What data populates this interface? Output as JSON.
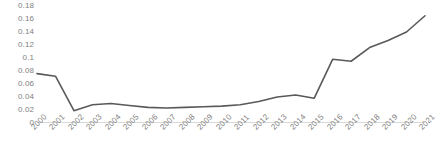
{
  "chart_data": {
    "type": "line",
    "title": "",
    "subtitle": "",
    "xlabel": "",
    "ylabel": "",
    "categories": [
      "2000",
      "2001",
      "2002",
      "2003",
      "2004",
      "2005",
      "2006",
      "2007",
      "2008",
      "2009",
      "2010",
      "2011",
      "2012",
      "2013",
      "2014",
      "2015",
      "2016",
      "2017",
      "2018",
      "2019",
      "2020",
      "2021"
    ],
    "values": [
      0.076,
      0.072,
      0.019,
      0.028,
      0.03,
      0.027,
      0.024,
      0.023,
      0.024,
      0.025,
      0.026,
      0.028,
      0.033,
      0.04,
      0.043,
      0.038,
      0.098,
      0.095,
      0.116,
      0.127,
      0.14,
      0.165
    ],
    "series": [
      {
        "name": "series-1",
        "color": "#595959",
        "values": [
          0.076,
          0.072,
          0.019,
          0.028,
          0.03,
          0.027,
          0.024,
          0.023,
          0.024,
          0.025,
          0.026,
          0.028,
          0.033,
          0.04,
          0.043,
          0.038,
          0.098,
          0.095,
          0.116,
          0.127,
          0.14,
          0.165
        ]
      }
    ],
    "ylim": [
      0,
      0.18
    ],
    "yticks": [
      0,
      0.02,
      0.04,
      0.06,
      0.08,
      0.1,
      0.12,
      0.14,
      0.16,
      0.18
    ],
    "ytick_labels": [
      "0",
      "0.02",
      "0.04",
      "0.06",
      "0.08",
      "0.1",
      "0.12",
      "0.14",
      "0.16",
      "0.18"
    ],
    "xtick_labels": [
      "2000",
      "2001",
      "2002",
      "2003",
      "2004",
      "2005",
      "2006",
      "2007",
      "2008",
      "2009",
      "2010",
      "2011",
      "2012",
      "2013",
      "2014",
      "2015",
      "2016",
      "2017",
      "2018",
      "2019",
      "2020",
      "2021"
    ],
    "xtick_rotation": -45,
    "grid": false,
    "legend": false,
    "legend_position": "none",
    "markers": false,
    "line_width": 1.6,
    "axis_line_color": "#d9d9d9",
    "tick_label_color": "#7f7f7f",
    "background": "#ffffff"
  }
}
